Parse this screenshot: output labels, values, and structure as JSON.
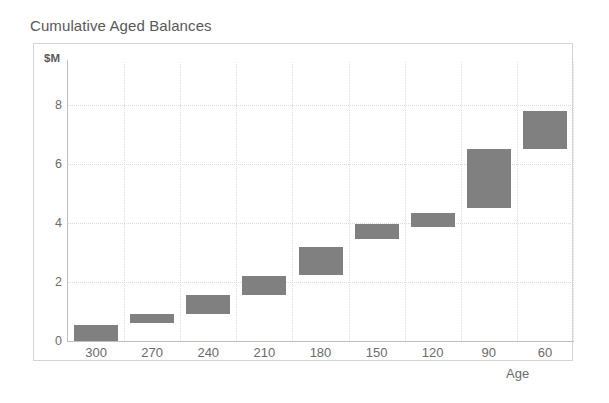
{
  "chart": {
    "title": "Cumulative Aged Balances",
    "y_unit_label": "$M",
    "x_axis_title": "Age"
  },
  "chart_data": {
    "type": "bar",
    "subtype": "floating-bar",
    "title": "Cumulative Aged Balances",
    "xlabel": "Age",
    "ylabel": "$M",
    "categories": [
      "300",
      "270",
      "240",
      "210",
      "180",
      "150",
      "120",
      "90",
      "60"
    ],
    "series": [
      {
        "name": "Cumulative Aged Balance Range",
        "low": [
          0.0,
          0.6,
          0.9,
          1.55,
          2.25,
          3.45,
          3.85,
          4.5,
          6.5
        ],
        "high": [
          0.55,
          0.9,
          1.55,
          2.2,
          3.2,
          3.95,
          4.35,
          6.5,
          7.8
        ]
      }
    ],
    "ylim": [
      0,
      9
    ],
    "yticks": [
      0,
      2,
      4,
      6,
      8
    ],
    "ytick_labels": [
      "0",
      "2",
      "4",
      "6",
      "8"
    ],
    "grid": true,
    "grid_style": "dotted",
    "legend": "none",
    "bar_color": "#808080",
    "grid_color": "#d9d9d9",
    "axis_color": "#bfbfbf",
    "text_color": "#6b6b6b",
    "title_color": "#595959"
  }
}
